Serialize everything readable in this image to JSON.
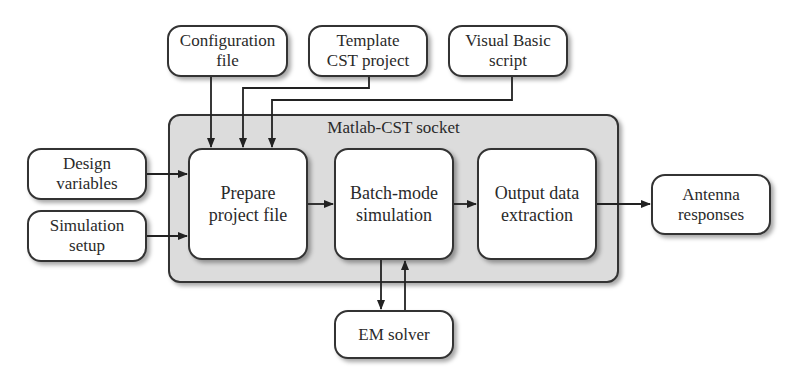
{
  "diagram": {
    "socket": {
      "title": "Matlab-CST socket"
    },
    "inputs_top": [
      {
        "id": "config",
        "label": "Configuration\nfile"
      },
      {
        "id": "template",
        "label": "Template\nCST project"
      },
      {
        "id": "vb",
        "label": "Visual Basic\nscript"
      }
    ],
    "inputs_left": [
      {
        "id": "design",
        "label": "Design\nvariables"
      },
      {
        "id": "simsetup",
        "label": "Simulation\nsetup"
      }
    ],
    "stages": [
      {
        "id": "prepare",
        "label": "Prepare\nproject file"
      },
      {
        "id": "batch",
        "label": "Batch-mode\nsimulation"
      },
      {
        "id": "output",
        "label": "Output data\nextraction"
      }
    ],
    "solver": {
      "label": "EM solver"
    },
    "result": {
      "label": "Antenna\nresponses"
    },
    "colors": {
      "socket_fill": "#dcdcdc",
      "stroke": "#333333",
      "box_fill": "#ffffff"
    }
  }
}
